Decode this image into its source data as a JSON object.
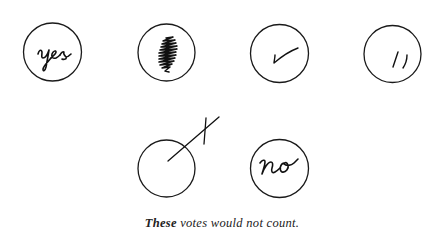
{
  "figure": {
    "caption_lead": "These",
    "caption_rest": " votes would not count.",
    "ink_color": "#111111",
    "ballots": [
      {
        "id": "yes",
        "mark": "written word",
        "text": "yes"
      },
      {
        "id": "scribble",
        "mark": "scribbled-in",
        "text": ""
      },
      {
        "id": "check",
        "mark": "check mark",
        "text": ""
      },
      {
        "id": "slashes",
        "mark": "two slashes",
        "text": ""
      },
      {
        "id": "cross-outside",
        "mark": "cross drawn outside circle",
        "text": ""
      },
      {
        "id": "no",
        "mark": "written word",
        "text": "no"
      }
    ]
  }
}
